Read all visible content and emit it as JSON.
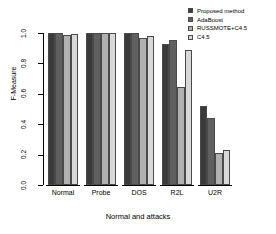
{
  "chart_data": {
    "type": "bar",
    "title": "",
    "xlabel": "Normal and attacks",
    "ylabel": "F-Measure",
    "categories": [
      "Normal",
      "Probe",
      "DOS",
      "R2L",
      "U2R"
    ],
    "ylim": [
      0.0,
      1.0
    ],
    "yticks": [
      "0.0",
      "0.2",
      "0.4",
      "0.6",
      "0.8",
      "1.0"
    ],
    "ytick_values": [
      0.0,
      0.2,
      0.4,
      0.6,
      0.8,
      1.0
    ],
    "grid": false,
    "legend_position": "top-right",
    "series": [
      {
        "name": "Proposed method",
        "color": "#3a3a3a",
        "values": [
          0.999,
          1.0,
          0.999,
          0.93,
          0.52
        ]
      },
      {
        "name": "AdaBoost",
        "color": "#606060",
        "values": [
          0.999,
          1.0,
          0.998,
          0.955,
          0.44
        ]
      },
      {
        "name": "RUSSMOTE+C4.5",
        "color": "#b0b0b0",
        "values": [
          0.985,
          0.999,
          0.965,
          0.645,
          0.21
        ]
      },
      {
        "name": "C4.5",
        "color": "#d8d8d8",
        "values": [
          0.996,
          1.0,
          0.982,
          0.89,
          0.23
        ]
      }
    ]
  },
  "axes": {
    "y_title": "F-Measure",
    "x_title": "Normal and attacks"
  }
}
